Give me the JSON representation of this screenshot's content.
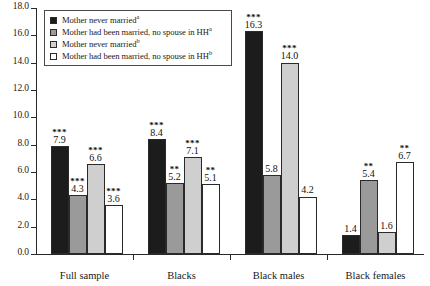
{
  "chart_data": {
    "type": "bar",
    "title": "",
    "xlabel": "",
    "ylabel": "",
    "ylim": [
      0.0,
      18.0
    ],
    "ytick_step": 2.0,
    "ytick_labels": [
      "0.0",
      "2.0",
      "4.0",
      "6.0",
      "8.0",
      "10.0",
      "12.0",
      "14.0",
      "16.0",
      "18.0"
    ],
    "grid": false,
    "legend_position": "top-left-inside",
    "categories": [
      "Full sample",
      "Blacks",
      "Black males",
      "Black females"
    ],
    "series": [
      {
        "name": "Mother never married",
        "name_superscript": "a",
        "color": "#1c1c1c",
        "values": [
          7.9,
          8.4,
          16.3,
          1.4
        ],
        "labels": [
          "7.9",
          "8.4",
          "16.3",
          "1.4"
        ],
        "significance": [
          "***",
          "***",
          "***",
          ""
        ]
      },
      {
        "name": "Mother had been married, no spouse in HH",
        "name_superscript": "a",
        "color": "#9a9a9a",
        "values": [
          4.3,
          5.2,
          5.8,
          5.4
        ],
        "labels": [
          "4.3",
          "5.2",
          "5.8",
          "5.4"
        ],
        "significance": [
          "***",
          "**",
          "",
          "**"
        ]
      },
      {
        "name": "Mother never married",
        "name_superscript": "b",
        "color": "#cfcfcf",
        "values": [
          6.6,
          7.1,
          14.0,
          1.6
        ],
        "labels": [
          "6.6",
          "7.1",
          "14.0",
          "1.6"
        ],
        "significance": [
          "***",
          "***",
          "***",
          ""
        ]
      },
      {
        "name": "Mother had been married, no spouse in HH",
        "name_superscript": "b",
        "color": "#ffffff",
        "values": [
          3.6,
          5.1,
          4.2,
          6.7
        ],
        "labels": [
          "3.6",
          "5.1",
          "4.2",
          "6.7"
        ],
        "significance": [
          "***",
          "**",
          "",
          "**"
        ]
      }
    ]
  }
}
